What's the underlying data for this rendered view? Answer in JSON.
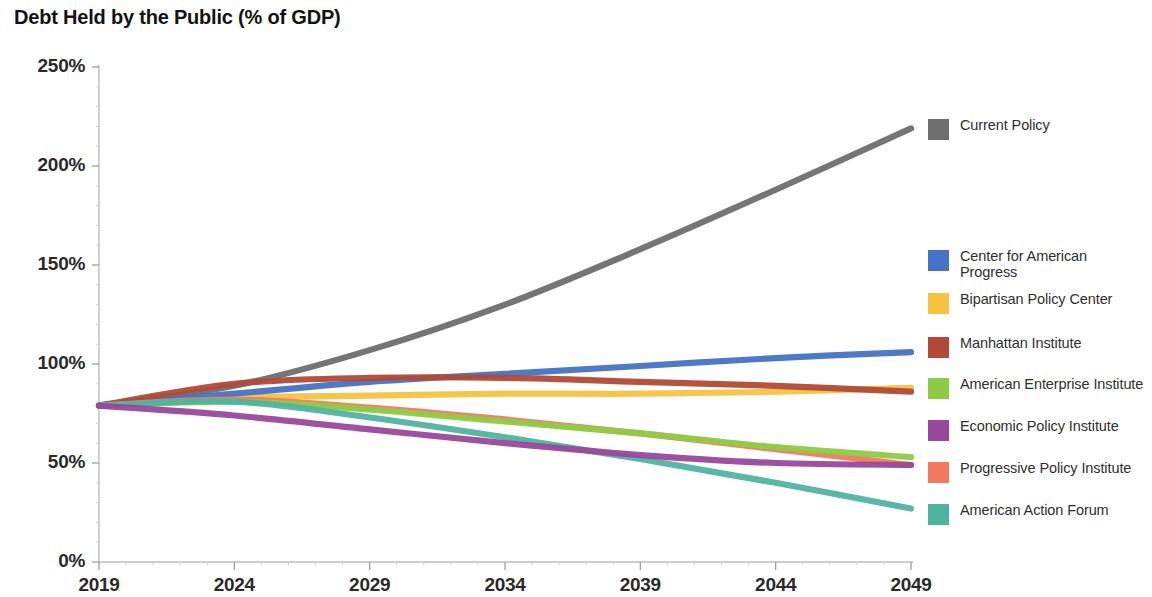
{
  "chart_data": {
    "type": "line",
    "title": "Debt Held by the Public (% of GDP)",
    "xlabel": "",
    "ylabel": "",
    "xlim": [
      2019,
      2049
    ],
    "ylim": [
      0,
      250
    ],
    "grid": false,
    "legend_position": "right",
    "x_ticks": [
      "2019",
      "2024",
      "2029",
      "2034",
      "2039",
      "2044",
      "2049"
    ],
    "y_ticks": [
      "0%",
      "50%",
      "100%",
      "150%",
      "200%",
      "250%"
    ],
    "x": [
      2019,
      2024,
      2029,
      2034,
      2039,
      2044,
      2049
    ],
    "series": [
      {
        "name": "Current Policy",
        "color": "#6e6e6e",
        "values": [
          79,
          89,
          107,
          130,
          158,
          188,
          219
        ]
      },
      {
        "name": "Center for American Progress",
        "color": "#4472c4",
        "values": [
          79,
          85,
          91,
          95,
          99,
          103,
          106
        ]
      },
      {
        "name": "Bipartisan Policy Center",
        "color": "#f5c242",
        "values": [
          79,
          83,
          84,
          85,
          85,
          86,
          88
        ]
      },
      {
        "name": "Manhattan Institute",
        "color": "#b04a36",
        "values": [
          79,
          90,
          93,
          93,
          91,
          89,
          86
        ]
      },
      {
        "name": "American Enterprise Institute",
        "color": "#8ecb45",
        "values": [
          79,
          81,
          77,
          71,
          65,
          58,
          53
        ]
      },
      {
        "name": "Economic Policy Institute",
        "color": "#99489b",
        "values": [
          79,
          74,
          67,
          60,
          54,
          50,
          49
        ]
      },
      {
        "name": "Progressive Policy Institute",
        "color": "#f07a5f",
        "values": [
          79,
          82,
          78,
          72,
          65,
          57,
          49
        ]
      },
      {
        "name": "American Action Forum",
        "color": "#4fb3a2",
        "values": [
          79,
          81,
          73,
          63,
          52,
          40,
          27
        ]
      }
    ]
  },
  "legend": {
    "items": [
      {
        "label": "Current Policy",
        "color": "#6e6e6e",
        "top": 14
      },
      {
        "label": "Center for American Progress",
        "color": "#4472c4",
        "top": 145
      },
      {
        "label": "Bipartisan Policy Center",
        "color": "#f5c242",
        "top": 188
      },
      {
        "label": "Manhattan Institute",
        "color": "#b04a36",
        "top": 232
      },
      {
        "label": "American Enterprise Institute",
        "color": "#8ecb45",
        "top": 273
      },
      {
        "label": "Economic Policy Institute",
        "color": "#99489b",
        "top": 315
      },
      {
        "label": "Progressive Policy Institute",
        "color": "#f07a5f",
        "top": 357
      },
      {
        "label": "American Action Forum",
        "color": "#4fb3a2",
        "top": 399
      }
    ]
  },
  "axes": {
    "y_label_positions": [
      68,
      167,
      266,
      364,
      463,
      552
    ],
    "x_label_positions": [
      99,
      234,
      370,
      505,
      641,
      776,
      911
    ]
  }
}
